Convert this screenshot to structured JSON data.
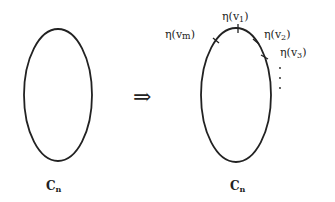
{
  "diagram": {
    "left_cycle": {
      "label": "C",
      "subscript": "n"
    },
    "arrow": "⇒",
    "right_cycle": {
      "label": "C",
      "subscript": "n",
      "vertices": [
        {
          "text": "η(v",
          "sub": "1",
          "close": ")"
        },
        {
          "text": "η(v",
          "sub": "2",
          "close": ")"
        },
        {
          "text": "η(v",
          "sub": "3",
          "close": ")"
        },
        {
          "text": "η(v",
          "sub": "m",
          "close": ")"
        }
      ],
      "ellipsis": "⋮"
    },
    "colors": {
      "stroke": "#222222",
      "background": "#ffffff"
    }
  }
}
